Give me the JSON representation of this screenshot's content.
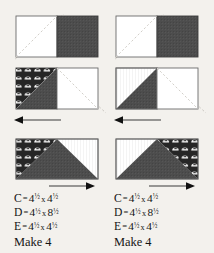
{
  "page": {
    "background_color": "#f3f1ed",
    "ink_color": "#141414",
    "fabric_dark_color": "#4a4a4a",
    "fabric_light_color": "#ffffff",
    "print_fabric_color": "#2b2b2b",
    "guide_line_color": "#c9c6c0"
  },
  "columns": [
    {
      "name": "left-unit",
      "steps": [
        {
          "step": 1,
          "name": "step-one",
          "description": "Rectangle with white square left and dark square right, dashed diagonal guide",
          "left_patch": "white",
          "right_patch": "dark-solid",
          "diagonal": "top-right-to-bottom-left"
        },
        {
          "step": 2,
          "name": "step-two",
          "description": "Print triangle sewn on left square, dark square left, white square right",
          "left_patch": "print-triangle-dark",
          "right_patch": "white",
          "arrow": "left"
        },
        {
          "step": 3,
          "name": "step-three",
          "description": "Completed unit: print upper-left, dark center triangle, white upper-right",
          "arrow": "right"
        }
      ],
      "legend": [
        {
          "label": "C",
          "eq": "=",
          "w": "4",
          "w_frac": "1/2",
          "x": "x",
          "h": "4",
          "h_frac": "1/2"
        },
        {
          "label": "D",
          "eq": "=",
          "w": "4",
          "w_frac": "1/2",
          "x": "x",
          "h": "8",
          "h_frac": "1/2"
        },
        {
          "label": "E",
          "eq": "=",
          "w": "4",
          "w_frac": "1/2",
          "x": "x",
          "h": "4",
          "h_frac": "1/2"
        }
      ],
      "make": "Make 4"
    },
    {
      "name": "right-unit",
      "steps": [
        {
          "step": 1,
          "name": "step-one",
          "description": "Rectangle with white square left and dark square right, dashed diagonal guide",
          "left_patch": "white",
          "right_patch": "dark-solid",
          "diagonal": "top-right-to-bottom-left"
        },
        {
          "step": 2,
          "name": "step-two",
          "description": "Dark solid triangle sewn on left square, white square right",
          "left_patch": "dark-triangle",
          "right_patch": "white",
          "arrow": "left"
        },
        {
          "step": 3,
          "name": "step-three",
          "description": "Completed mirrored unit: white upper-left, dark center triangle, print upper-right",
          "arrow": "right"
        }
      ],
      "legend": [
        {
          "label": "C",
          "eq": "=",
          "w": "4",
          "w_frac": "1/2",
          "x": "x",
          "h": "4",
          "h_frac": "1/2"
        },
        {
          "label": "D",
          "eq": "=",
          "w": "4",
          "w_frac": "1/2",
          "x": "x",
          "h": "8",
          "h_frac": "1/2"
        },
        {
          "label": "E",
          "eq": "=",
          "w": "4",
          "w_frac": "1/2",
          "x": "x",
          "h": "4",
          "h_frac": "1/2"
        }
      ],
      "make": "Make 4"
    }
  ]
}
